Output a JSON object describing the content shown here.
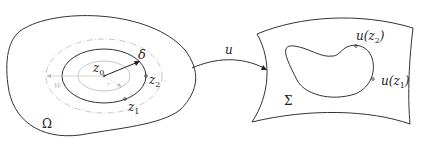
{
  "diagram": {
    "left_domain": {
      "region_label": "Ω",
      "center_label": "z",
      "center_sub": "0",
      "radius_label": "δ",
      "points": [
        {
          "label": "z",
          "sub": "2"
        },
        {
          "label": "z",
          "sub": "1"
        }
      ],
      "inner_radius_label": "r",
      "outer_radius_label": "W"
    },
    "map": {
      "label": "u"
    },
    "right_domain": {
      "region_label": "Σ",
      "points": [
        {
          "label": "u(z",
          "sub": "2",
          "close": ")"
        },
        {
          "label": "u(z",
          "sub": "1",
          "close": ")"
        }
      ]
    },
    "colors": {
      "stroke": "#333333",
      "grey": "#bbbbbb",
      "background": "#ffffff"
    }
  }
}
